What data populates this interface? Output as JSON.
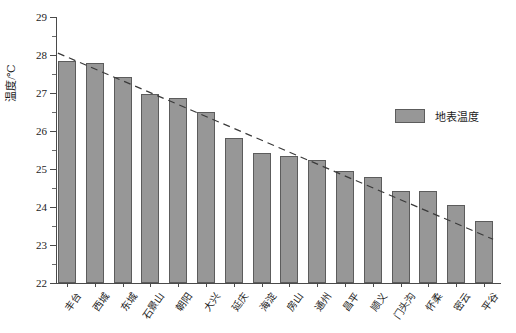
{
  "chart_data": {
    "type": "bar",
    "title": "",
    "xlabel": "",
    "ylabel": "温度/℃",
    "ylim": [
      22,
      29
    ],
    "ytick_step": 1,
    "yticks": [
      22,
      23,
      24,
      25,
      26,
      27,
      28,
      29
    ],
    "ytick_labels": [
      "22",
      "23",
      "24",
      "25",
      "26",
      "27",
      "28",
      "29"
    ],
    "minor_ticks": true,
    "grid": false,
    "legend": {
      "position": "right",
      "entries": [
        {
          "label": "地表温度",
          "color": "#979797"
        }
      ]
    },
    "categories": [
      "丰台",
      "西城",
      "东城",
      "石景山",
      "朝阳",
      "大兴",
      "延庆",
      "海淀",
      "房山",
      "通州",
      "昌平",
      "顺义",
      "门头沟",
      "怀柔",
      "密云",
      "平谷"
    ],
    "series": [
      {
        "name": "地表温度",
        "color": "#979797",
        "values": [
          27.85,
          27.78,
          27.42,
          26.97,
          26.88,
          26.5,
          25.82,
          25.42,
          25.33,
          25.25,
          24.95,
          24.8,
          24.42,
          24.42,
          24.05,
          23.62
        ]
      }
    ],
    "annotations": [
      {
        "type": "trendline",
        "style": "dashed",
        "color": "#3a3a3a",
        "from": {
          "x": 0,
          "y": 28.05
        },
        "to": {
          "x": 16,
          "y": 23.15
        }
      }
    ]
  },
  "legend": {
    "label": "地表温度"
  },
  "axes": {
    "y_title": "温度/℃"
  }
}
